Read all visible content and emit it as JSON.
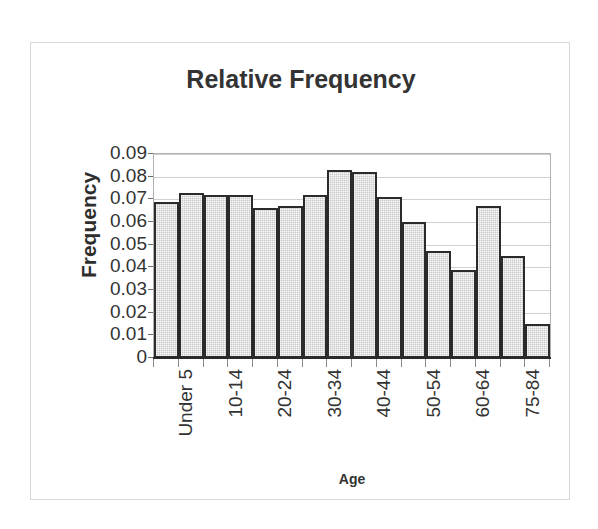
{
  "chart_data": {
    "type": "bar",
    "title": "Relative Frequency",
    "xlabel": "Age",
    "ylabel": "Frequency",
    "categories": [
      "Under 5",
      "5-9",
      "10-14",
      "15-19",
      "20-24",
      "25-29",
      "30-34",
      "35-39",
      "40-44",
      "45-49",
      "50-54",
      "55-59",
      "60-64",
      "65-74",
      "75-84",
      "85+"
    ],
    "values": [
      0.069,
      0.073,
      0.072,
      0.072,
      0.066,
      0.067,
      0.072,
      0.083,
      0.082,
      0.071,
      0.06,
      0.047,
      0.039,
      0.067,
      0.045,
      0.015
    ],
    "visible_tick_labels": [
      "Under 5",
      "",
      "10-14",
      "",
      "20-24",
      "",
      "30-34",
      "",
      "40-44",
      "",
      "50-54",
      "",
      "60-64",
      "",
      "75-84",
      ""
    ],
    "ytick_labels": [
      "0.09",
      "0.08",
      "0.07",
      "0.06",
      "0.05",
      "0.04",
      "0.03",
      "0.02",
      "0.01",
      "0"
    ],
    "ytick_values": [
      0.09,
      0.08,
      0.07,
      0.06,
      0.05,
      0.04,
      0.03,
      0.02,
      0.01,
      0
    ],
    "ylim": [
      0,
      0.09
    ],
    "grid": true,
    "legend": false,
    "bar_fill_color": "#c8c8c8",
    "bar_border_color": "#2b2b2b",
    "gridline_color": "#d0d0d0",
    "text_color": "#333333",
    "frame_color": "#d9d9d9"
  }
}
